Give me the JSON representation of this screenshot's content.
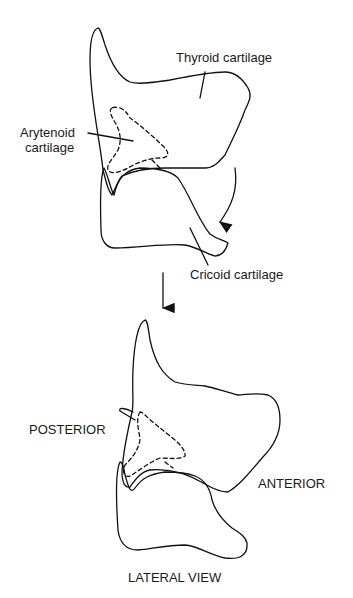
{
  "diagram": {
    "top_view": {
      "labels": {
        "thyroid": "Thyroid cartilage",
        "arytenoid_line1": "Arytenoid",
        "arytenoid_line2": "cartilage",
        "cricoid": "Cricoid cartilage"
      }
    },
    "bottom_view": {
      "labels": {
        "posterior": "POSTERIOR",
        "anterior": "ANTERIOR",
        "caption": "LATERAL VIEW"
      }
    },
    "colors": {
      "stroke": "#111111",
      "background": "#ffffff"
    }
  }
}
